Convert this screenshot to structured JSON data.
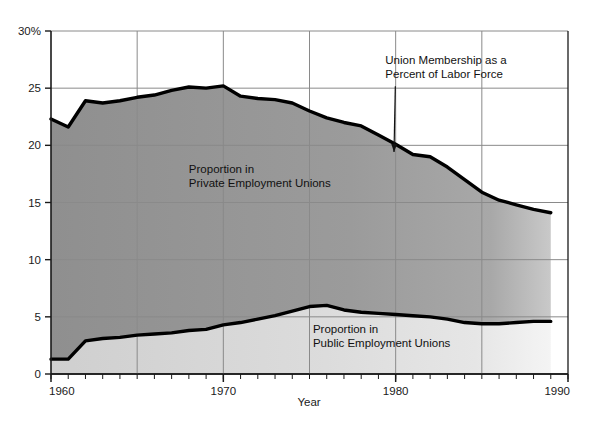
{
  "chart_data": {
    "type": "area",
    "title": "",
    "subtitle": "",
    "xlabel": "Year",
    "ylabel": "",
    "xlim": [
      1960,
      1990
    ],
    "ylim": [
      0,
      30
    ],
    "grid": true,
    "legend_position": "inline-annotations",
    "x": [
      1960,
      1961,
      1962,
      1963,
      1964,
      1965,
      1966,
      1967,
      1968,
      1969,
      1970,
      1971,
      1972,
      1973,
      1974,
      1975,
      1976,
      1977,
      1978,
      1979,
      1980,
      1981,
      1982,
      1983,
      1984,
      1985,
      1986,
      1987,
      1988,
      1989
    ],
    "xticks": [
      1960,
      1970,
      1980,
      1990
    ],
    "xticklabels": [
      "1960",
      "1970",
      "1980",
      "1990"
    ],
    "xminor_tick_interval": 1,
    "xgridline_interval": 5,
    "yticks": [
      0,
      5,
      10,
      15,
      20,
      25,
      30
    ],
    "yticklabels": [
      "0",
      "5",
      "10",
      "15",
      "20",
      "25",
      "30%"
    ],
    "series": [
      {
        "name": "Union Membership as a Percent of Labor Force",
        "role": "total-upper-boundary",
        "values": [
          22.3,
          21.6,
          23.9,
          23.7,
          23.9,
          24.2,
          24.4,
          24.8,
          25.1,
          25.0,
          25.2,
          24.3,
          24.1,
          24.0,
          23.7,
          23.0,
          22.4,
          22.0,
          21.7,
          20.9,
          20.1,
          19.2,
          19.0,
          18.1,
          17.0,
          15.9,
          15.2,
          14.8,
          14.4,
          14.1
        ],
        "color": "#000000"
      },
      {
        "name": "Proportion in Public Employment Unions",
        "role": "lower-boundary",
        "values": [
          1.3,
          1.3,
          2.9,
          3.1,
          3.2,
          3.4,
          3.5,
          3.6,
          3.8,
          3.9,
          4.3,
          4.5,
          4.8,
          5.1,
          5.5,
          5.9,
          6.0,
          5.6,
          5.4,
          5.3,
          5.2,
          5.1,
          5.0,
          4.8,
          4.5,
          4.4,
          4.4,
          4.5,
          4.6,
          4.6
        ],
        "color": "#000000"
      }
    ],
    "bands": [
      {
        "name": "Proportion in Private Employment Unions",
        "between": [
          "Proportion in Public Employment Unions",
          "Union Membership as a Percent of Labor Force"
        ],
        "fill": "#969696"
      },
      {
        "name": "Proportion in Public Employment Unions",
        "between": [
          "baseline",
          "Proportion in Public Employment Unions"
        ],
        "fill": "#d4d4d4"
      }
    ],
    "annotations": [
      {
        "id": "private-band-label",
        "text_lines": [
          "Proportion in",
          "Private Employment Unions"
        ],
        "x": 1968.0,
        "y": 17.6
      },
      {
        "id": "public-band-label",
        "text_lines": [
          "Proportion in",
          "Public Employment Unions"
        ],
        "x": 1975.2,
        "y": 3.6
      },
      {
        "id": "total-curve-callout",
        "text_lines": [
          "Union Membership as a",
          "Percent of Labor Force"
        ],
        "x": 1979.4,
        "y": 27.1,
        "points_to_x": 1980.6,
        "points_to_y": 19.6,
        "has_leader_line": true
      }
    ]
  },
  "colors": {
    "background": "#ffffff",
    "axis": "#1a1a1a",
    "gridline": "#808080",
    "curve": "#000000",
    "private_band": "#969696",
    "public_band": "#d4d4d4"
  }
}
